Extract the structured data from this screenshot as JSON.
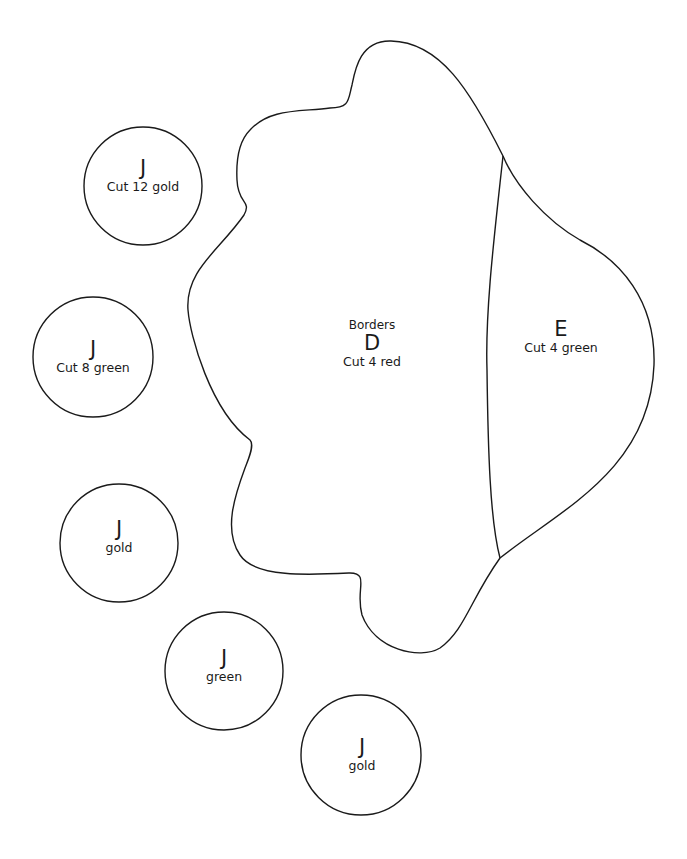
{
  "pieces": {
    "D": {
      "top_label": "Borders",
      "letter": "D",
      "instruction": "Cut 4 red"
    },
    "E": {
      "letter": "E",
      "instruction": "Cut 4 green"
    },
    "circles": [
      {
        "letter": "J",
        "instruction": "Cut 12 gold"
      },
      {
        "letter": "J",
        "instruction": "Cut 8 green"
      },
      {
        "letter": "J",
        "instruction": "gold"
      },
      {
        "letter": "J",
        "instruction": "green"
      },
      {
        "letter": "J",
        "instruction": "gold"
      }
    ]
  },
  "colors": {
    "line": "#1a1a1a",
    "background": "#ffffff"
  }
}
